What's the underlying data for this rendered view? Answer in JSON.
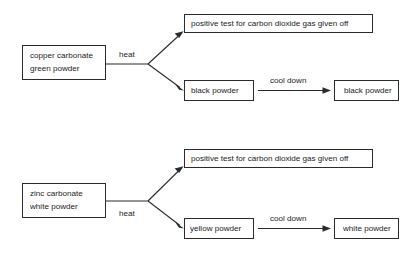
{
  "diagram": {
    "type": "flowchart",
    "orientation": "left-to-right",
    "colors": {
      "background": "#ffffff",
      "stroke": "#2b2b2b",
      "text": "#1c1c1c"
    },
    "branches": [
      {
        "id": "copper-branch",
        "source": {
          "line1": "copper carbonate",
          "line2": "green powder"
        },
        "process_label": "heat",
        "outputs": [
          {
            "id": "copper-gas-test",
            "label": "positive test for carbon dioxide gas given off"
          },
          {
            "id": "copper-residue",
            "label": "black powder"
          }
        ],
        "secondary_process_label": "cool down",
        "final_product": {
          "id": "copper-cooled",
          "label": "black powder"
        }
      },
      {
        "id": "zinc-branch",
        "source": {
          "line1": "zinc carbonate",
          "line2": "white powder"
        },
        "process_label": "heat",
        "outputs": [
          {
            "id": "zinc-gas-test",
            "label": "positive test for carbon dioxide gas given off"
          },
          {
            "id": "zinc-residue",
            "label": "yellow powder"
          }
        ],
        "secondary_process_label": "cool down",
        "final_product": {
          "id": "zinc-cooled",
          "label": "white powder"
        }
      }
    ]
  }
}
